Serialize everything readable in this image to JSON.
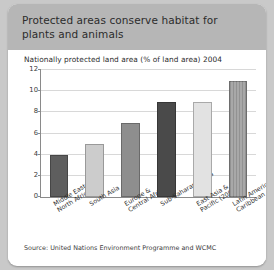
{
  "figure": {
    "header_title": "Protected areas conserve habitat for plants and animals",
    "source_note": "Source: United Nations Environment Programme and WCMC"
  },
  "chart_data": {
    "type": "bar",
    "title": "Nationally protected land area (% of land area) 2004",
    "xlabel": "",
    "ylabel": "",
    "ylim": [
      0,
      12
    ],
    "yticks": [
      0,
      2,
      4,
      6,
      8,
      10,
      12
    ],
    "grid": true,
    "legend": "none",
    "categories": [
      "Middle East & North Africa",
      "South Asia",
      "Europe & Central Africa",
      "Sub-Saharan Africa",
      "East Asia & Pacific (2003)",
      "Latin America & Caribbean"
    ],
    "values": [
      4,
      5,
      7,
      9,
      9,
      11
    ],
    "bar_colors": [
      "#5e5e5e",
      "#cccccc",
      "#8e8e8e",
      "#4a4a4a",
      "#e2e2e2",
      "#a8a8a8"
    ]
  }
}
